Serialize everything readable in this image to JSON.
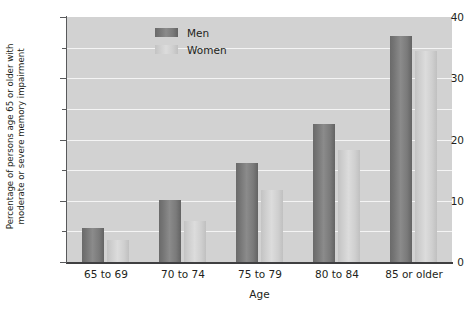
{
  "chart_data": {
    "type": "bar",
    "title": "",
    "xlabel": "Age",
    "ylabel": "Percentage of persons age 65 or older with moderate or severe memory impairment",
    "ylabel_lines": [
      "Percentage of persons age 65 or older with",
      "moderate or severe memory impairment"
    ],
    "categories": [
      "65 to 69",
      "70 to 74",
      "75 to 79",
      "80 to 84",
      "85 or older"
    ],
    "series": [
      {
        "name": "Men",
        "values": [
          5.5,
          10.2,
          16.1,
          22.6,
          36.9
        ],
        "color": "#7f7f7f"
      },
      {
        "name": "Women",
        "values": [
          3.6,
          6.7,
          11.7,
          18.3,
          34.5
        ],
        "color": "#d2d2d2"
      }
    ],
    "ylim": [
      0,
      40
    ],
    "ytick_labels": [
      "0",
      "10",
      "20",
      "30",
      "40"
    ],
    "ytick_values": [
      0,
      10,
      20,
      30,
      40
    ],
    "yminor_tick_values": [
      5,
      15,
      25,
      35
    ],
    "grid": true,
    "gridline_values": [
      5,
      10,
      15,
      20,
      25,
      30,
      35
    ],
    "legend": {
      "position": "top-center",
      "entries": [
        {
          "label": "Men",
          "swatch": "men-swatch"
        },
        {
          "label": "Women",
          "swatch": "women-swatch"
        }
      ]
    },
    "plot_background": "#d2d2d2",
    "gridline_color": "#f4f4f4",
    "axis_color": "#58595b",
    "text_color": "#231f20"
  }
}
